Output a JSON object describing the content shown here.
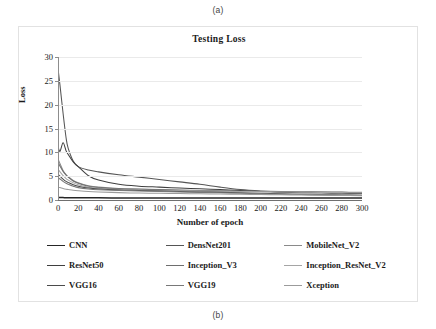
{
  "figure": {
    "caption_top": "(a)",
    "caption_bottom": "(b)"
  },
  "chart_data": {
    "type": "line",
    "title": "Testing  Loss",
    "xlabel": "Number of epoch",
    "ylabel": "Loss",
    "xlim": [
      0,
      300
    ],
    "ylim": [
      0,
      30
    ],
    "xticks": [
      0,
      20,
      40,
      60,
      80,
      100,
      120,
      140,
      160,
      180,
      200,
      220,
      240,
      260,
      280,
      300
    ],
    "yticks": [
      0,
      5,
      10,
      15,
      20,
      25,
      30
    ],
    "grid": "horizontal",
    "legend_position": "below-plot",
    "legend_columns": 3,
    "x": [
      0,
      2,
      5,
      8,
      10,
      15,
      20,
      30,
      40,
      60,
      80,
      100,
      120,
      140,
      160,
      180,
      200,
      220,
      240,
      260,
      280,
      300
    ],
    "series": [
      {
        "name": "CNN",
        "color": "#262626",
        "values": [
          0.55,
          0.52,
          0.5,
          0.49,
          0.48,
          0.47,
          0.46,
          0.45,
          0.45,
          0.44,
          0.44,
          0.43,
          0.43,
          0.42,
          0.42,
          0.42,
          0.41,
          0.41,
          0.41,
          0.4,
          0.4,
          0.4
        ]
      },
      {
        "name": "DensNet201",
        "color": "#555555",
        "values": [
          27.6,
          24.0,
          18.2,
          13.0,
          10.9,
          8.2,
          7.0,
          6.3,
          5.9,
          5.3,
          4.8,
          4.3,
          3.8,
          3.3,
          2.7,
          2.2,
          1.9,
          1.7,
          1.6,
          1.5,
          1.45,
          1.4
        ]
      },
      {
        "name": "MobileNet_V2",
        "color": "#8a8a8a",
        "values": [
          8.6,
          7.6,
          6.2,
          5.3,
          4.9,
          4.1,
          3.6,
          3.0,
          2.7,
          2.4,
          2.3,
          2.2,
          2.1,
          2.0,
          1.95,
          1.9,
          1.85,
          1.8,
          1.75,
          1.7,
          1.65,
          1.6
        ]
      },
      {
        "name": "ResNet50",
        "color": "#3f3f3f",
        "values": [
          11.2,
          10.2,
          12.0,
          10.3,
          9.6,
          8.0,
          7.0,
          5.1,
          4.2,
          3.3,
          2.9,
          2.7,
          2.5,
          2.35,
          2.2,
          2.0,
          1.8,
          1.65,
          1.55,
          1.5,
          1.45,
          1.4
        ]
      },
      {
        "name": "Inception_V3",
        "color": "#6e6e6e",
        "values": [
          7.9,
          7.1,
          6.0,
          5.2,
          4.8,
          4.0,
          3.5,
          2.9,
          2.6,
          2.35,
          2.25,
          2.15,
          2.05,
          1.95,
          1.9,
          1.85,
          1.8,
          1.75,
          1.7,
          1.65,
          1.6,
          1.55
        ]
      },
      {
        "name": "Inception_ResNet_V2",
        "color": "#a5a5a5",
        "values": [
          6.4,
          5.9,
          5.1,
          4.5,
          4.2,
          3.6,
          3.2,
          2.7,
          2.45,
          2.2,
          2.1,
          2.0,
          1.95,
          1.9,
          1.85,
          1.8,
          1.75,
          1.7,
          1.65,
          1.6,
          1.55,
          1.5
        ]
      },
      {
        "name": "VGG16",
        "color": "#4b4b4b",
        "values": [
          5.4,
          5.0,
          4.4,
          3.9,
          3.7,
          3.2,
          2.9,
          2.5,
          2.3,
          2.1,
          2.0,
          1.9,
          1.8,
          1.7,
          1.6,
          1.5,
          1.4,
          1.3,
          1.2,
          1.1,
          1.05,
          1.0
        ]
      },
      {
        "name": "VGG19",
        "color": "#787878",
        "values": [
          4.7,
          4.4,
          3.9,
          3.5,
          3.3,
          2.9,
          2.6,
          2.3,
          2.15,
          2.0,
          1.9,
          1.8,
          1.7,
          1.6,
          1.5,
          1.4,
          1.3,
          1.2,
          1.15,
          1.1,
          1.05,
          1.0
        ]
      },
      {
        "name": "Xception",
        "color": "#9b9b9b",
        "values": [
          2.7,
          2.6,
          2.4,
          2.25,
          2.2,
          2.05,
          1.95,
          1.8,
          1.7,
          1.55,
          1.45,
          1.4,
          1.35,
          1.3,
          1.25,
          1.2,
          1.15,
          1.1,
          1.05,
          1.0,
          0.95,
          0.9
        ]
      }
    ]
  }
}
